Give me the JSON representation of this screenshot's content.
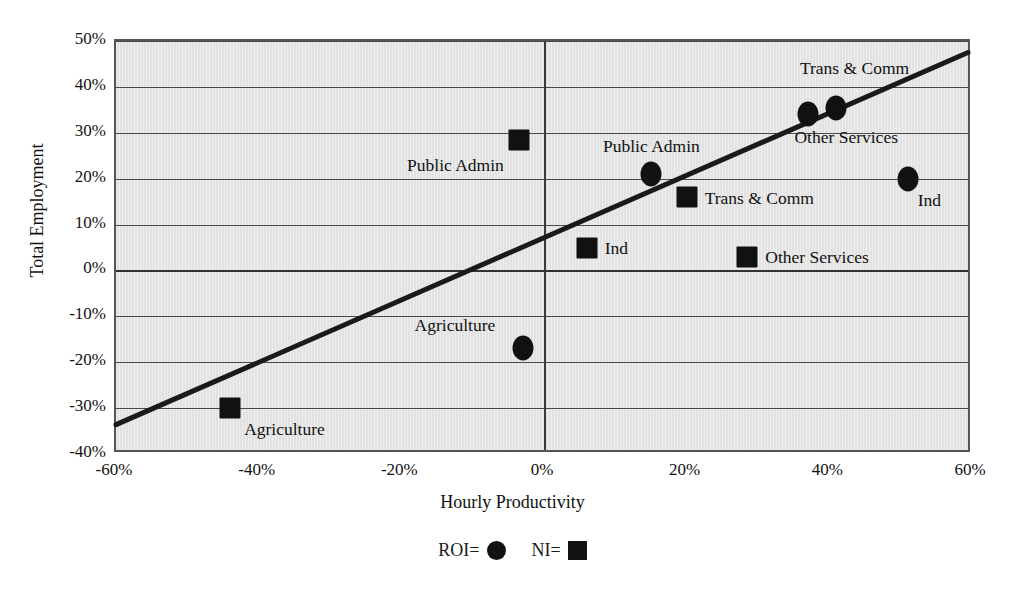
{
  "chart_data": {
    "type": "scatter",
    "title": "",
    "xlabel": "Hourly Productivity",
    "ylabel": "Total Employment",
    "xlim": [
      -60,
      60
    ],
    "ylim": [
      -40,
      50
    ],
    "xticks": [
      "-60%",
      "-40%",
      "-20%",
      "0%",
      "20%",
      "40%",
      "60%"
    ],
    "xtick_values": [
      -60,
      -40,
      -20,
      0,
      20,
      40,
      60
    ],
    "yticks": [
      "-40%",
      "-30%",
      "-20%",
      "-10%",
      "0%",
      "10%",
      "20%",
      "30%",
      "40%",
      "50%"
    ],
    "ytick_values": [
      -40,
      -30,
      -20,
      -10,
      0,
      10,
      20,
      30,
      40,
      50
    ],
    "grid": "horizontal-plus-zero-vertical",
    "legend_position": "bottom-center",
    "series": [
      {
        "name": "ROI",
        "marker": "circle",
        "color": "#111111",
        "points": [
          {
            "label": "Agriculture",
            "x": -3,
            "y": -17,
            "label_dx": -108,
            "label_dy": -22
          },
          {
            "label": "Public Admin",
            "x": 15,
            "y": 21,
            "label_dx": -48,
            "label_dy": -27
          },
          {
            "label": "Trans & Comm",
            "x": 37,
            "y": 34,
            "label_dx": -8,
            "label_dy": -45
          },
          {
            "label": "Other Services",
            "x": 41,
            "y": 35.5,
            "label_dx": -42,
            "label_dy": 30
          },
          {
            "label": "Ind",
            "x": 51,
            "y": 20,
            "label_dx": 10,
            "label_dy": 22
          }
        ]
      },
      {
        "name": "NI",
        "marker": "square",
        "color": "#111111",
        "points": [
          {
            "label": "Agriculture",
            "x": -44,
            "y": -30,
            "label_dx": 14,
            "label_dy": 22
          },
          {
            "label": "Public Admin",
            "x": -3.5,
            "y": 28.5,
            "label_dx": -112,
            "label_dy": 26
          },
          {
            "label": "Ind",
            "x": 6,
            "y": 5,
            "label_dx": 18,
            "label_dy": 1
          },
          {
            "label": "Trans & Comm",
            "x": 20,
            "y": 16,
            "label_dx": 18,
            "label_dy": 2
          },
          {
            "label": "Other Services",
            "x": 28.5,
            "y": 3,
            "label_dx": 18,
            "label_dy": 1
          }
        ]
      }
    ],
    "trendline": {
      "name": "linear-fit",
      "x_start": -60,
      "y_start": -34,
      "x_end": 60,
      "y_end": 47.5,
      "color": "#1a1a1a",
      "width_px": 5
    },
    "legend": [
      {
        "label": "ROI=",
        "marker": "circle"
      },
      {
        "label": "NI=",
        "marker": "square"
      }
    ]
  }
}
